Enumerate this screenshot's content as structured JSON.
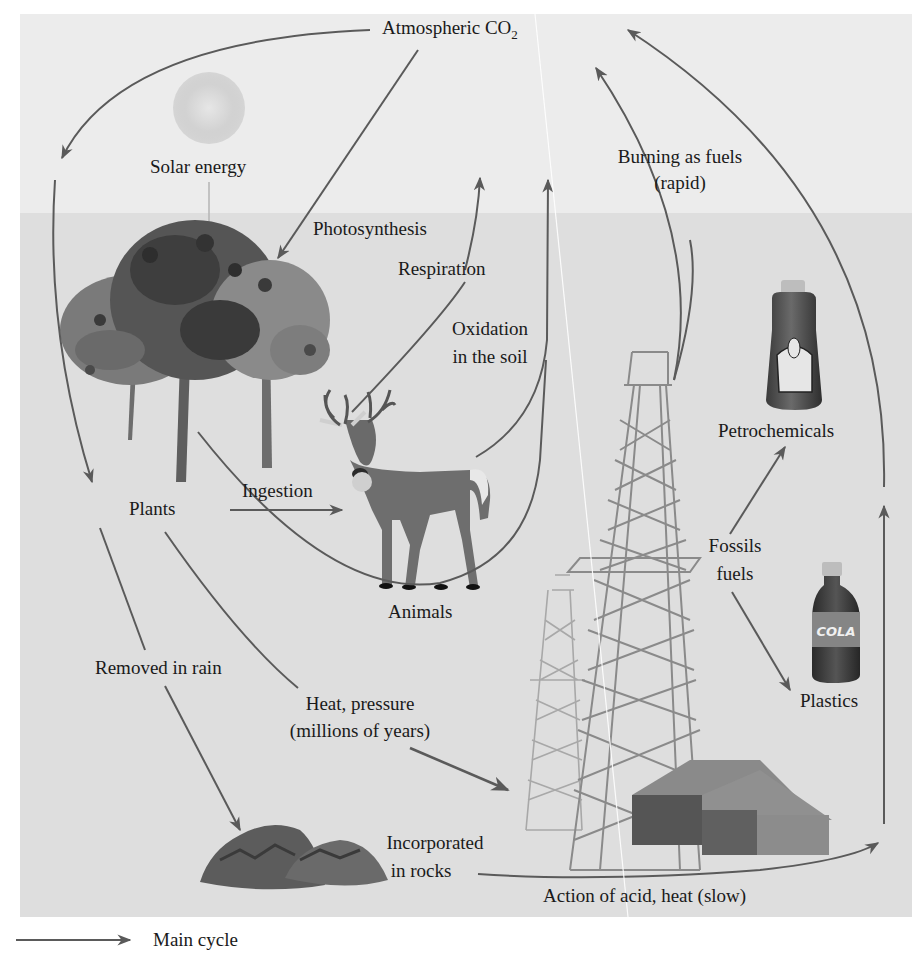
{
  "figure": {
    "colors": {
      "sky_band": "#ececec",
      "ground_band": "#dedede",
      "arrow": "#5a5a5a",
      "text": "#1a1a1a"
    }
  },
  "nodes": {
    "atmospheric_co2": {
      "label": "Atmospheric CO",
      "subscript": "2"
    },
    "solar_energy": {
      "label": "Solar energy"
    },
    "plants": {
      "label": "Plants"
    },
    "animals": {
      "label": "Animals"
    },
    "petrochemicals": {
      "label": "Petrochemicals"
    },
    "fossil_fuels": {
      "line1": "Fossils",
      "line2": "fuels"
    },
    "plastics": {
      "label": "Plastics"
    },
    "rocks": {
      "line1": "Incorporated",
      "line2": "in rocks"
    }
  },
  "processes": {
    "photosynthesis": "Photosynthesis",
    "respiration": "Respiration",
    "oxidation": {
      "line1": "Oxidation",
      "line2": "in the soil"
    },
    "burning": {
      "line1": "Burning as fuels",
      "line2": "(rapid)"
    },
    "ingestion": "Ingestion",
    "removed_in_rain": "Removed in rain",
    "heat_pressure": {
      "line1": "Heat, pressure",
      "line2": "(millions of years)"
    },
    "acid_heat": "Action of acid, heat (slow)"
  },
  "bottle_labels": {
    "cleaner": "Household Cleaner",
    "cola": "COLA"
  },
  "legend": {
    "items": [
      {
        "label": "Main cycle",
        "icon": "arrow-right-icon"
      }
    ]
  }
}
